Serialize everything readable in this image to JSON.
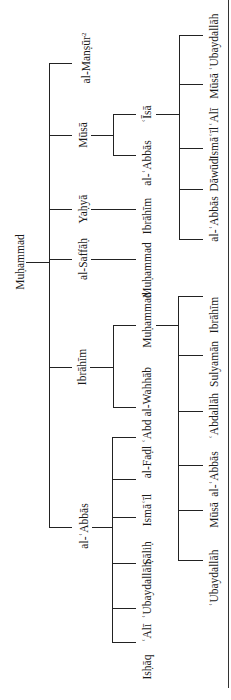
{
  "diagram": {
    "type": "genealogical-tree",
    "orientation": "rotated-90-ccw",
    "root": {
      "name": "Muḥammad",
      "children": [
        {
          "name": "al-Manṣūr",
          "note_marker": "2",
          "children": []
        },
        {
          "name": "Mūsā",
          "children": [
            {
              "name": "al-ʿAbbās",
              "children": []
            },
            {
              "name": "ʿĪsā",
              "children": [
                {
                  "name": "al-ʿAbbās"
                },
                {
                  "name": "Dāwūd"
                },
                {
                  "name": "Ismāʿīl"
                },
                {
                  "name": "ʿAlī"
                },
                {
                  "name": "Mūsā"
                },
                {
                  "name": "ʿUbaydallāh"
                }
              ]
            }
          ]
        },
        {
          "name": "Yaḥyā",
          "children": [
            {
              "name": "Ibrāhīm",
              "children": []
            }
          ]
        },
        {
          "name": "al-Saffāḥ",
          "children": [
            {
              "name": "Muḥammad",
              "children": []
            }
          ]
        },
        {
          "name": "Ibrāhīm",
          "children": [
            {
              "name": "ʿAbd al-Wahhāb",
              "children": []
            },
            {
              "name": "Muḥammad",
              "children": [
                {
                  "name": "ʿUbaydallāh"
                },
                {
                  "name": "Mūsā"
                },
                {
                  "name": "al-ʿAbbās"
                },
                {
                  "name": "ʿAbdallāh"
                },
                {
                  "name": "Sulyamān"
                },
                {
                  "name": "Ibrāhīm"
                }
              ]
            }
          ]
        },
        {
          "name": "al-ʿAbbās",
          "children": [
            {
              "name": "Isḥāq"
            },
            {
              "name": "ʿAlī"
            },
            {
              "name": "ʿUbaydallāh"
            },
            {
              "name": "Ṣāliḥ"
            },
            {
              "name": "Ismāʿīl"
            },
            {
              "name": "al-Faḍl"
            }
          ]
        }
      ]
    }
  },
  "labels": {
    "root": "Muḥammad",
    "g1": {
      "mansur": "al-Manṣūr",
      "mansur_note": "2",
      "musa": "Mūsā",
      "yahya": "Yaḥyā",
      "saffah": "al-Saffāḥ",
      "ibrahim": "Ibrāhīm",
      "abbas": "al-ʿAbbās"
    },
    "g2": {
      "musa_abbas": "al-ʿAbbās",
      "musa_isa": "ʿĪsā",
      "yahya_ibrahim": "Ibrāhīm",
      "saffah_muhammad": "Muḥammad",
      "ibrahim_abdalwahhab": "ʿAbd al-Wahhāb",
      "ibrahim_muhammad": "Muḥammad",
      "abbas_ishaq": "Isḥāq",
      "abbas_ali": "ʿAlī",
      "abbas_ubaydallah": "ʿUbaydallāh",
      "abbas_salih": "Ṣāliḥ",
      "abbas_ismail": "Ismāʿīl",
      "abbas_fadl": "al-Faḍl"
    },
    "g3_isa": [
      "al-ʿAbbās",
      "Dāwūd",
      "Ismāʿīl",
      "ʿAlī",
      "Mūsā",
      "ʿUbaydallāh"
    ],
    "g3_muhammad": [
      "ʿUbaydallāh",
      "Mūsā",
      "al-ʿAbbās",
      "ʿAbdallāh",
      "Sulyamān",
      "Ibrāhīm"
    ]
  }
}
